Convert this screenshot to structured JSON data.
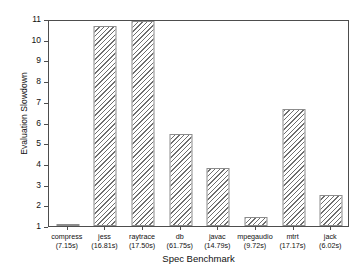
{
  "chart_data": {
    "type": "bar",
    "title": "",
    "xlabel": "Spec Benchmark",
    "ylabel": "Evaluation Slowdown",
    "categories": [
      "compress",
      "jess",
      "raytrace",
      "db",
      "javac",
      "mpegaudio",
      "mtrt",
      "jack"
    ],
    "category_sublabels": [
      "(7.15s)",
      "(16.81s)",
      "(17.50s)",
      "(61.75s)",
      "(14.79s)",
      "(9.72s)",
      "(17.17s)",
      "(6.02s)"
    ],
    "values": [
      1.07,
      10.65,
      10.92,
      5.45,
      3.8,
      1.45,
      6.65,
      2.5
    ],
    "ylim": [
      1,
      11
    ],
    "yticks": [
      11,
      10,
      9,
      8,
      7,
      6,
      5,
      4,
      3,
      2,
      1
    ],
    "ytick_labels": [
      "11",
      "10",
      "9",
      "8",
      "7",
      "6",
      "5",
      "4",
      "3",
      "2",
      "1"
    ],
    "grid": false,
    "legend": "none",
    "bar_fill": "diagonal-hatch",
    "bar_edge_color": "#8c8c8c",
    "axis_color": "#4d4d4d"
  }
}
